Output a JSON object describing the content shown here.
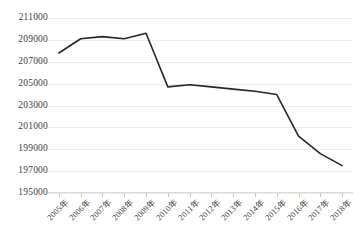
{
  "chart_data": {
    "type": "line",
    "title": "",
    "subtitle": "",
    "xlabel": "",
    "ylabel": "",
    "categories": [
      "2005年",
      "2006年",
      "2007年",
      "2008年",
      "2009年",
      "2010年",
      "2011年",
      "2012年",
      "2013年",
      "2014年",
      "2015年",
      "2016年",
      "2017年",
      "2018年"
    ],
    "values": [
      207800,
      209100,
      209300,
      209100,
      209600,
      204700,
      204900,
      204700,
      204500,
      204300,
      204000,
      200200,
      198600,
      197500
    ],
    "series": [
      {
        "name": "",
        "values": [
          207800,
          209100,
          209300,
          209100,
          209600,
          204700,
          204900,
          204700,
          204500,
          204300,
          204000,
          200200,
          198600,
          197500
        ]
      }
    ],
    "ylim": [
      195000,
      211000
    ],
    "ytick_labels": [
      "211000",
      "209000",
      "207000",
      "205000",
      "203000",
      "201000",
      "199000",
      "197000",
      "195000"
    ],
    "ytick_values": [
      211000,
      209000,
      207000,
      205000,
      203000,
      201000,
      199000,
      197000,
      195000
    ],
    "ytick_step": 2000,
    "grid": true,
    "legend": false,
    "legend_position": "none",
    "line_color": "#262626",
    "grid_color": "#ececec",
    "background_color": "#ffffff",
    "markers": false
  }
}
